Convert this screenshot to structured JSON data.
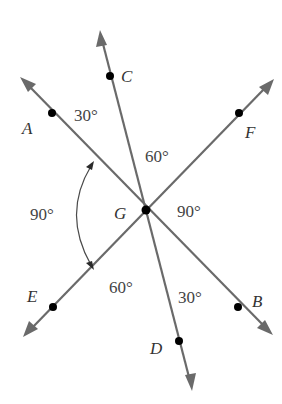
{
  "diagram": {
    "type": "intersecting-lines-angles",
    "center_point": {
      "label": "G"
    },
    "lines": [
      {
        "name": "line-AB",
        "endpoints": [
          "A",
          "B"
        ]
      },
      {
        "name": "line-CD",
        "endpoints": [
          "C",
          "D"
        ]
      },
      {
        "name": "line-EF",
        "endpoints": [
          "E",
          "F"
        ]
      }
    ],
    "points": {
      "A": "A",
      "B": "B",
      "C": "C",
      "D": "D",
      "E": "E",
      "F": "F",
      "G": "G"
    },
    "angles": {
      "AGC": "30°",
      "CGF": "60°",
      "FGB": "90°",
      "BGD": "30°",
      "DGE": "60°",
      "EGA": "90°"
    },
    "colors": {
      "line": "#6a6a6a",
      "point": "#000000",
      "text": "#333333"
    }
  }
}
